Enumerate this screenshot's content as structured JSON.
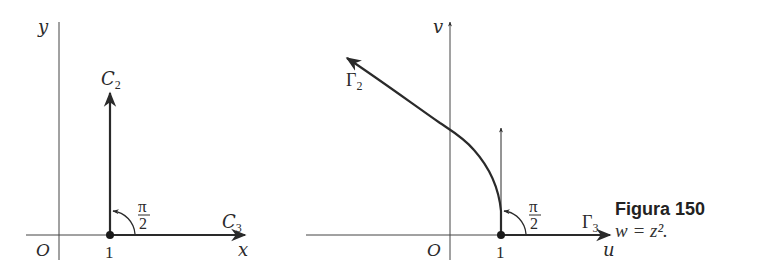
{
  "figure": {
    "caption_title": "Figura 150",
    "caption_equation": "w = z².",
    "colors": {
      "ink": "#2a2a2a",
      "background": "#ffffff"
    }
  },
  "left_plot": {
    "y_axis_label": "y",
    "x_axis_label": "x",
    "origin_label": "O",
    "point_label": "1",
    "curve_vertical_label": "C",
    "curve_vertical_sub": "2",
    "curve_horizontal_label": "C",
    "curve_horizontal_sub": "3",
    "angle_num": "π",
    "angle_den": "2"
  },
  "right_plot": {
    "v_axis_label": "v",
    "u_axis_label": "u",
    "origin_label": "O",
    "point_label": "1",
    "curve_image_label": "Γ",
    "curve_image_sub": "2",
    "curve_horizontal_label": "Γ",
    "curve_horizontal_sub": "3",
    "angle_num": "π",
    "angle_den": "2"
  }
}
